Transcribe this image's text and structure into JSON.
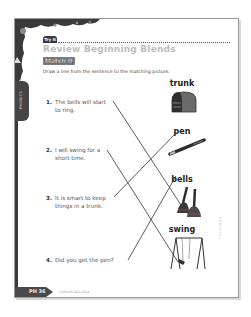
{
  "worksheet": {
    "badge": "Try It",
    "title": "Review Beginning Blends",
    "subtitle": "Match It",
    "instructions": "Draw a line from the sentence to the matching picture.",
    "side_tab_label": "PHONICS",
    "sentences": [
      {
        "number": "1.",
        "line1": "The bells will start",
        "line2": "to ring."
      },
      {
        "number": "2.",
        "line1": "I will swing for a",
        "line2": "short time."
      },
      {
        "number": "3.",
        "line1": "It is smart to keep",
        "line2": "things in a trunk."
      },
      {
        "number": "4.",
        "line1": "Did you get the pen?",
        "line2": ""
      }
    ],
    "pictures": [
      {
        "label": "trunk",
        "icon": "trunk-icon"
      },
      {
        "label": "pen",
        "icon": "pen-icon"
      },
      {
        "label": "bells",
        "icon": "bells-icon"
      },
      {
        "label": "swing",
        "icon": "swing-icon"
      }
    ],
    "matches": [
      {
        "sentence": 1,
        "picture": "bells"
      },
      {
        "sentence": 2,
        "picture": "swing"
      },
      {
        "sentence": 3,
        "picture": "trunk"
      },
      {
        "sentence": 4,
        "picture": "pen"
      }
    ],
    "footer": {
      "page_label": "PH 36",
      "publisher_text": "CARSON-DELLOSA"
    },
    "colors": {
      "dark": "#3a3a3a",
      "title_gray": "#bdbdbd",
      "line": "#333333"
    }
  }
}
